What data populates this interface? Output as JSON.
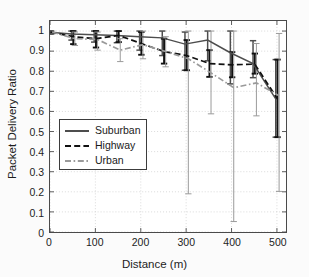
{
  "chart_data": {
    "type": "line",
    "title": "",
    "xlabel": "Distance (m)",
    "ylabel": "Packet Delivery Ratio",
    "xlim": [
      0,
      520
    ],
    "ylim": [
      0,
      1.05
    ],
    "xticks": [
      0,
      100,
      200,
      300,
      400,
      500
    ],
    "xtick_labels": [
      "0",
      "100",
      "200",
      "300",
      "400",
      "500"
    ],
    "yticks": [
      0,
      0.1,
      0.2,
      0.3,
      0.4,
      0.5,
      0.6,
      0.7,
      0.8,
      0.9,
      1
    ],
    "ytick_labels": [
      "0",
      "0.1",
      "0.2",
      "0.3",
      "0.4",
      "0.5",
      "0.6",
      "0.7",
      "0.8",
      "0.9",
      "1"
    ],
    "grid": true,
    "grid_style": "dotted",
    "legend_position": "lower-left",
    "x": [
      0,
      50,
      100,
      150,
      200,
      250,
      300,
      350,
      400,
      450,
      500
    ],
    "series": [
      {
        "name": "Suburban",
        "style": "solid",
        "color": "#4d4d4d",
        "values": [
          0.995,
          0.985,
          0.982,
          0.978,
          0.972,
          0.966,
          0.935,
          0.955,
          0.892,
          0.838,
          0.662
        ],
        "err_low": [
          0.985,
          0.955,
          0.945,
          0.942,
          0.905,
          0.878,
          0.805,
          0.852,
          0.737,
          0.768,
          0.472
        ],
        "err_high": [
          1.0,
          1.0,
          1.0,
          1.0,
          1.0,
          1.0,
          0.995,
          1.0,
          1.0,
          0.952,
          0.858
        ]
      },
      {
        "name": "Highway",
        "style": "dashed",
        "color": "#111111",
        "values": [
          0.995,
          0.972,
          0.962,
          0.978,
          0.938,
          0.898,
          0.878,
          0.838,
          0.832,
          0.835,
          0.662
        ],
        "err_low": [
          0.985,
          0.935,
          0.918,
          0.945,
          0.882,
          0.838,
          0.805,
          0.772,
          0.77,
          0.788,
          0.472
        ],
        "err_high": [
          1.0,
          1.0,
          1.0,
          1.0,
          0.995,
          0.962,
          0.955,
          0.905,
          0.895,
          0.888,
          0.858
        ]
      },
      {
        "name": "Urban",
        "style": "dashdot",
        "color": "#9a9a9a",
        "values": [
          0.995,
          0.962,
          0.958,
          0.905,
          0.932,
          0.898,
          0.862,
          0.792,
          0.718,
          0.742,
          0.678
        ],
        "err_low": [
          0.985,
          0.928,
          0.905,
          0.848,
          0.862,
          0.822,
          0.19,
          0.588,
          0.052,
          0.578,
          0.202
        ],
        "err_high": [
          1.0,
          0.995,
          0.995,
          0.962,
          1.0,
          0.972,
          1.0,
          1.0,
          1.0,
          0.938,
          0.988
        ]
      }
    ],
    "legend": [
      {
        "label": "Suburban",
        "style": "solid",
        "color": "#4d4d4d"
      },
      {
        "label": "Highway",
        "style": "dashed",
        "color": "#111111"
      },
      {
        "label": "Urban",
        "style": "dashdot",
        "color": "#9a9a9a"
      }
    ]
  }
}
